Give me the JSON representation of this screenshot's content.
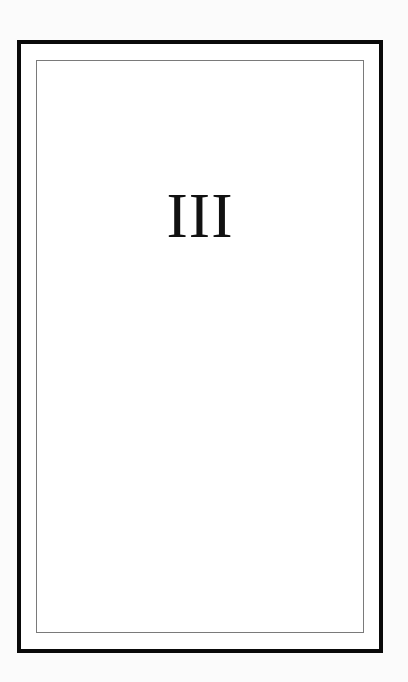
{
  "page": {
    "heading": "III"
  },
  "colors": {
    "outer_border": "#0a0a0a",
    "inner_border": "#7a7a7a",
    "text": "#111111",
    "background": "#ffffff"
  }
}
